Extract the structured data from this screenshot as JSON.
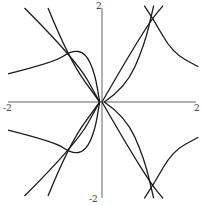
{
  "chart_data": {
    "type": "line",
    "title": "",
    "xlabel": "",
    "ylabel": "",
    "xlim": [
      -2,
      2
    ],
    "ylim": [
      -2,
      2
    ],
    "grid": false,
    "legend": null,
    "x_tick_labels": [
      "-2",
      "2"
    ],
    "y_tick_labels": [
      "2",
      "-2"
    ],
    "axes_through_origin": true,
    "series": [
      {
        "name": "upper-left steep line A",
        "points": [
          [
            -1.65,
            2.0
          ],
          [
            -0.55,
            0.9
          ],
          [
            -0.05,
            0.0
          ]
        ]
      },
      {
        "name": "upper-left steep line B",
        "points": [
          [
            -1.15,
            2.0
          ],
          [
            -0.7,
            0.9
          ],
          [
            -0.05,
            0.0
          ]
        ]
      },
      {
        "name": "upper-left loop",
        "points": [
          [
            -2.0,
            0.6
          ],
          [
            -1.0,
            0.85
          ],
          [
            -0.65,
            1.1
          ],
          [
            -0.35,
            1.05
          ],
          [
            -0.15,
            0.6
          ],
          [
            -0.05,
            0.0
          ]
        ]
      },
      {
        "name": "lower-left steep line A",
        "points": [
          [
            -1.65,
            -2.0
          ],
          [
            -0.55,
            -0.9
          ],
          [
            -0.05,
            0.0
          ]
        ]
      },
      {
        "name": "lower-left steep line B",
        "points": [
          [
            -1.15,
            -2.0
          ],
          [
            -0.7,
            -0.9
          ],
          [
            -0.05,
            0.0
          ]
        ]
      },
      {
        "name": "lower-left loop",
        "points": [
          [
            -2.0,
            -0.6
          ],
          [
            -1.0,
            -0.85
          ],
          [
            -0.65,
            -1.1
          ],
          [
            -0.35,
            -1.05
          ],
          [
            -0.15,
            -0.6
          ],
          [
            -0.05,
            0.0
          ]
        ]
      },
      {
        "name": "upper-right line",
        "points": [
          [
            0.0,
            0.0
          ],
          [
            0.55,
            0.95
          ],
          [
            1.05,
            1.75
          ],
          [
            1.3,
            2.05
          ]
        ]
      },
      {
        "name": "upper-right arc",
        "points": [
          [
            0.05,
            0.0
          ],
          [
            0.5,
            0.3
          ],
          [
            0.9,
            1.2
          ],
          [
            1.1,
            2.05
          ]
        ]
      },
      {
        "name": "upper-right decaying curve",
        "points": [
          [
            0.9,
            2.05
          ],
          [
            1.1,
            1.75
          ],
          [
            1.5,
            1.05
          ],
          [
            2.05,
            0.75
          ]
        ]
      },
      {
        "name": "lower-right line",
        "points": [
          [
            0.0,
            0.0
          ],
          [
            0.55,
            -0.95
          ],
          [
            1.05,
            -1.75
          ],
          [
            1.3,
            -2.05
          ]
        ]
      },
      {
        "name": "lower-right arc",
        "points": [
          [
            0.05,
            0.0
          ],
          [
            0.5,
            -0.3
          ],
          [
            0.9,
            -1.2
          ],
          [
            1.1,
            -2.05
          ]
        ]
      },
      {
        "name": "lower-right decaying curve",
        "points": [
          [
            0.9,
            -2.05
          ],
          [
            1.1,
            -1.75
          ],
          [
            1.5,
            -1.05
          ],
          [
            2.05,
            -0.75
          ]
        ]
      }
    ]
  },
  "colors": {
    "curve": "#1a1a1a",
    "axis": "#555555",
    "background": "#ffffff"
  }
}
